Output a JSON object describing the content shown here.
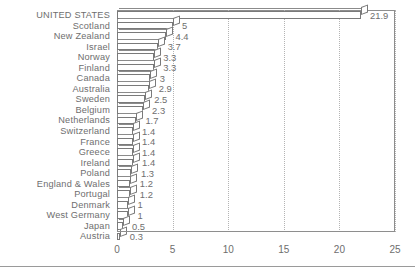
{
  "chart_data": {
    "type": "bar",
    "orientation": "horizontal",
    "title": "",
    "subtitle": "",
    "xlabel": "",
    "ylabel": "",
    "xlim": [
      0,
      25
    ],
    "xticks": [
      0,
      5,
      10,
      15,
      20,
      25
    ],
    "xtick_labels": [
      "0",
      "5",
      "10",
      "15",
      "20",
      "25"
    ],
    "grid": "vertical-dotted",
    "legend": "none",
    "style": "3d-horizontal-bars",
    "categories": [
      "UNITED STATES",
      "Scotland",
      "New Zealand",
      "Israel",
      "Norway",
      "Finland",
      "Canada",
      "Australia",
      "Sweden",
      "Belgium",
      "Netherlands",
      "Switzerland",
      "France",
      "Greece",
      "Ireland",
      "Poland",
      "England & Wales",
      "Portugal",
      "Denmark",
      "West Germany",
      "Japan",
      "Austria"
    ],
    "values": [
      21.9,
      5,
      4.4,
      3.7,
      3.3,
      3.3,
      3,
      2.9,
      2.5,
      2.3,
      1.7,
      1.4,
      1.4,
      1.4,
      1.4,
      1.3,
      1.2,
      1.2,
      1,
      1,
      0.5,
      0.3
    ],
    "value_labels": [
      "21.9",
      "5",
      "4.4",
      "3.7",
      "3.3",
      "3.3",
      "3",
      "2.9",
      "2.5",
      "2.3",
      "1.7",
      "1.4",
      "1.4",
      "1.4",
      "1.4",
      "1.3",
      "1.2",
      "1.2",
      "1",
      "1",
      "0.5",
      "0.3"
    ]
  },
  "colors": {
    "bar_fill": "#ffffff",
    "bar_outline": "#7a7a7a",
    "text": "#6e6e6e",
    "gridline": "#b4b4b4",
    "frame": "#8e8e8e",
    "background": "#ffffff"
  }
}
